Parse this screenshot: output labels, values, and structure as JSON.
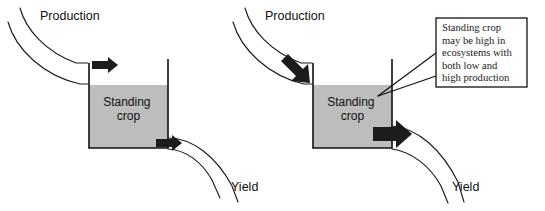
{
  "figure": {
    "type": "conceptual-diagram",
    "panel_count": 2
  },
  "colors": {
    "standing_crop_fill": "#bdbdbd",
    "outline": "#111111",
    "arrow": "#1c1c1c",
    "background": "#ffffff",
    "callout_border": "#111111"
  },
  "panels": [
    {
      "id": "low-production",
      "inflow_label": "Production",
      "outflow_label": "Yield",
      "tank_label_line1": "Standing",
      "tank_label_line2": "crop",
      "inflow_magnitude": "low",
      "outflow_magnitude": "low",
      "standing_crop_level": "high"
    },
    {
      "id": "high-production",
      "inflow_label": "Production",
      "outflow_label": "Yield",
      "tank_label_line1": "Standing",
      "tank_label_line2": "crop",
      "inflow_magnitude": "high",
      "outflow_magnitude": "high",
      "standing_crop_level": "high"
    }
  ],
  "callout": {
    "lines": [
      "Standing crop",
      "may be high in",
      "ecosystems with",
      "both low and",
      "high production"
    ],
    "full_text": "Standing crop may be high in ecosystems with both low and high production",
    "leader_line_count": 2
  }
}
